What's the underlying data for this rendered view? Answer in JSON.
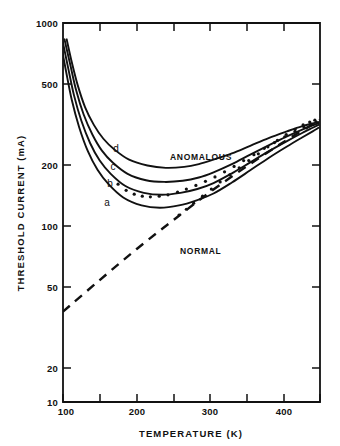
{
  "chart_data": {
    "type": "line",
    "title": "",
    "xlabel": "TEMPERATURE  (K)",
    "ylabel": "THRESHOLD CURRENT  (mA)",
    "xscale": "linear",
    "yscale": "log",
    "xlim": [
      100,
      450
    ],
    "ylim": [
      10,
      1000
    ],
    "grid": false,
    "legend": "none",
    "xticks": [
      100,
      150,
      200,
      250,
      300,
      350,
      400,
      450
    ],
    "xtick_labels": [
      "100",
      "",
      "200",
      "",
      "300",
      "",
      "400",
      ""
    ],
    "yticks": [
      10,
      20,
      50,
      100,
      200,
      500,
      1000
    ],
    "ytick_labels": [
      "10",
      "20",
      "50",
      "100",
      "200",
      "500",
      "1000"
    ],
    "annotations": [
      {
        "text": "ANOMALOUS",
        "x": 255,
        "y": 195
      },
      {
        "text": "NORMAL",
        "x": 258,
        "y": 63
      },
      {
        "text": "d",
        "x": 152,
        "y": 225
      },
      {
        "text": "c",
        "x": 148,
        "y": 180
      },
      {
        "text": "b",
        "x": 144,
        "y": 148
      },
      {
        "text": "a",
        "x": 141,
        "y": 118
      }
    ],
    "series": [
      {
        "name": "d",
        "label": "d",
        "style": "solid",
        "x": [
          105,
          112,
          120,
          130,
          142,
          155,
          170,
          190,
          215,
          240,
          265,
          285,
          305,
          330,
          355,
          380,
          405,
          425,
          440,
          448
        ],
        "y": [
          820,
          620,
          470,
          360,
          290,
          245,
          215,
          190,
          177,
          172,
          174,
          180,
          190,
          205,
          225,
          247,
          268,
          285,
          295,
          300
        ]
      },
      {
        "name": "c",
        "label": "c",
        "style": "solid",
        "x": [
          102,
          110,
          118,
          128,
          140,
          153,
          168,
          188,
          213,
          238,
          263,
          285,
          305,
          330,
          355,
          380,
          405,
          425,
          440,
          448
        ],
        "y": [
          820,
          600,
          440,
          330,
          258,
          212,
          183,
          160,
          148,
          145,
          147,
          153,
          163,
          180,
          202,
          226,
          252,
          273,
          288,
          296
        ]
      },
      {
        "name": "b",
        "label": "b",
        "style": "solid",
        "x": [
          99,
          107,
          115,
          125,
          137,
          150,
          165,
          185,
          210,
          235,
          260,
          283,
          305,
          330,
          355,
          380,
          405,
          425,
          440,
          448
        ],
        "y": [
          820,
          580,
          415,
          305,
          232,
          188,
          160,
          138,
          127,
          124,
          127,
          133,
          143,
          161,
          184,
          210,
          238,
          262,
          280,
          290
        ]
      },
      {
        "name": "a",
        "label": "a",
        "style": "solid",
        "x": [
          96,
          104,
          112,
          122,
          134,
          147,
          162,
          182,
          207,
          232,
          258,
          282,
          305,
          330,
          355,
          380,
          405,
          425,
          440,
          448
        ],
        "y": [
          820,
          560,
          392,
          282,
          210,
          168,
          141,
          120,
          109,
          106,
          109,
          116,
          126,
          144,
          167,
          194,
          223,
          248,
          268,
          280
        ]
      },
      {
        "name": "NORMAL",
        "label": "NORMAL",
        "style": "dashed",
        "x": [
          100,
          150,
          200,
          250,
          300,
          350,
          400,
          440,
          450
        ],
        "y": [
          30,
          44,
          64,
          91,
          128,
          175,
          235,
          292,
          308
        ]
      }
    ],
    "scatter": [
      {
        "name": "anomalous-data-b",
        "x": [
          175,
          186,
          197,
          208,
          219,
          231,
          243,
          256,
          268,
          281,
          294,
          307,
          320,
          333,
          346,
          360,
          374,
          388,
          402,
          416,
          428,
          438,
          445
        ],
        "y": [
          141,
          131,
          125,
          122,
          121,
          122,
          124,
          128,
          133,
          139,
          146,
          154,
          164,
          175,
          188,
          202,
          218,
          234,
          251,
          268,
          283,
          293,
          300
        ]
      },
      {
        "name": "normal-data",
        "x": [
          258,
          268,
          278,
          290,
          302,
          314,
          327,
          340,
          353,
          366,
          379,
          392,
          404,
          416,
          427,
          436,
          443
        ],
        "y": [
          97,
          104,
          112,
          122,
          133,
          145,
          158,
          172,
          188,
          204,
          222,
          240,
          258,
          275,
          290,
          300,
          307
        ]
      }
    ]
  },
  "labels": {
    "xlabel": "TEMPERATURE  (K)",
    "ylabel": "THRESHOLD CURRENT  (mA)",
    "anomalous": "ANOMALOUS",
    "normal": "NORMAL",
    "curve_a": "a",
    "curve_b": "b",
    "curve_c": "c",
    "curve_d": "d"
  },
  "ytick_labels": {
    "t1000": "1000",
    "t500": "500",
    "t200": "200",
    "t100": "100",
    "t50": "50",
    "t20": "20",
    "t10": "10"
  },
  "xtick_labels": {
    "t100": "100",
    "t200": "200",
    "t300": "300",
    "t400": "400"
  },
  "colors": {
    "ink": "#111111",
    "background": "#ffffff"
  }
}
